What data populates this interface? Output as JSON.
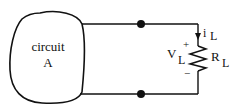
{
  "diagram": {
    "type": "circuit",
    "block": {
      "label_line1": "circuit",
      "label_line2": "A"
    },
    "load": {
      "current_label": "i",
      "current_sub": "L",
      "voltage_label": "V",
      "voltage_sub": "L",
      "plus": "+",
      "minus": "−",
      "resistor_label": "R",
      "resistor_sub": "L"
    },
    "terminals": 2,
    "colors": {
      "stroke": "#111111",
      "background": "#ffffff"
    }
  }
}
